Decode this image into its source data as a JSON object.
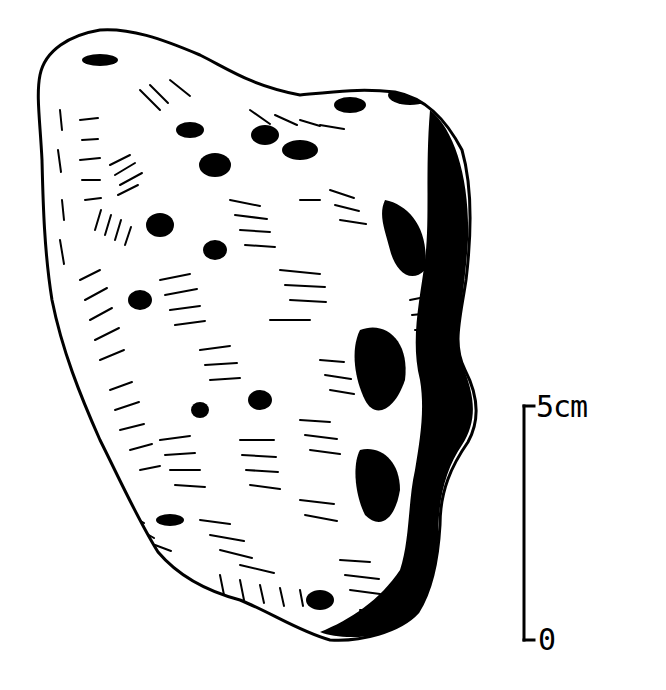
{
  "figure": {
    "style": "black ink stipple and hatch line drawing",
    "colors": {
      "ink": "#000000",
      "paper": "#ffffff"
    }
  },
  "scale_bar": {
    "top_label": "5cm",
    "bottom_label": "0",
    "length_px": 235
  }
}
